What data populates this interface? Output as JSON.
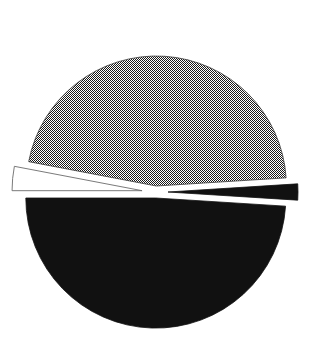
{
  "figure": {
    "width": 312,
    "height": 355,
    "background_color": "#ffffff",
    "title": "",
    "subtitle": "",
    "has_labels": false,
    "has_legend": false,
    "has_axes": false
  },
  "geometry": {
    "center_x": 156,
    "center_y": 192,
    "radius": 130,
    "explode_distance": 6,
    "start_angle_deg": 180,
    "direction": "counterclockwise"
  },
  "chart_data": {
    "type": "pie",
    "title": "",
    "xlabel": "",
    "ylabel": "",
    "legend_position": "none",
    "grid": false,
    "exploded": true,
    "categories": [
      "Slice 1",
      "Slice 2",
      "Slice 3",
      "Slice 4"
    ],
    "values": [
      49.0,
      2.0,
      46.0,
      3.0
    ],
    "labels_shown": [],
    "slices": [
      {
        "name": "Slice 1",
        "value": 49.0,
        "percent": "49%",
        "start_angle_deg": 3,
        "end_angle_deg": 179,
        "fill_style": "solid",
        "fill_color": "#111111",
        "edge_color": "#111111",
        "exploded": true,
        "explode_offset": 6,
        "position": "top"
      },
      {
        "name": "Slice 2",
        "value": 2.0,
        "percent": "2%",
        "start_angle_deg": 179,
        "end_angle_deg": 186,
        "fill_style": "solid",
        "fill_color": "#111111",
        "edge_color": "#111111",
        "exploded": true,
        "explode_offset": 12,
        "position": "left"
      },
      {
        "name": "Slice 3",
        "value": 46.0,
        "percent": "46%",
        "start_angle_deg": 186,
        "end_angle_deg": 352,
        "fill_style": "checkerboard-dither",
        "fill_color": "#4f4f4f",
        "edge_color": "#3a3a3a",
        "exploded": true,
        "explode_offset": 6,
        "position": "bottom"
      },
      {
        "name": "Slice 4",
        "value": 3.0,
        "percent": "3%",
        "start_angle_deg": 352,
        "end_angle_deg": 3,
        "fill_style": "none",
        "fill_color": "#ffffff",
        "edge_color": "#6b6b6b",
        "exploded": true,
        "explode_offset": 14,
        "position": "right"
      }
    ]
  },
  "colors": {
    "black": "#111111",
    "dither_gray": "#4f4f4f",
    "white": "#ffffff",
    "thin_outline": "#6b6b6b"
  }
}
